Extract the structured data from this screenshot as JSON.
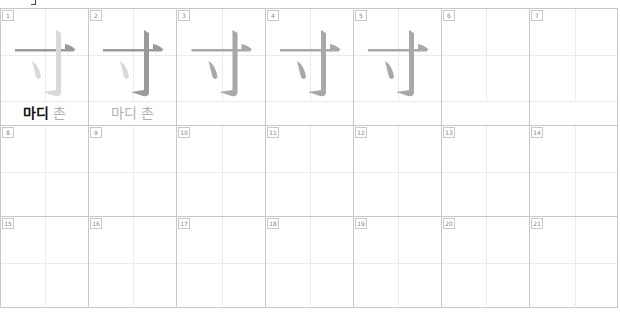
{
  "sheet": {
    "character": "寸",
    "columns": 7,
    "rows": 3,
    "cell_width": 88,
    "first_row_height": 117,
    "row_height": 91,
    "colors": {
      "grid_line": "#c8c8c8",
      "guide_line": "#ececec",
      "stroke_highlight": "#9a9a9a",
      "stroke_faint": "#d9d9d9",
      "stroke_complete": "#a8a8a8",
      "label_dark": "#111111",
      "label_light": "#b0b0b0"
    }
  },
  "cells": [
    {
      "number": "1",
      "strokes_shown": 3,
      "highlight_stroke": 1,
      "label_meaning": "마디",
      "label_sound": "촌",
      "label_style": "dark"
    },
    {
      "number": "2",
      "strokes_shown": 3,
      "highlight_stroke": 2,
      "label_meaning": "마디",
      "label_sound": "촌",
      "label_style": "light"
    },
    {
      "number": "3",
      "strokes_shown": 3,
      "highlight_stroke": 0
    },
    {
      "number": "4",
      "strokes_shown": 3,
      "highlight_stroke": 0
    },
    {
      "number": "5",
      "strokes_shown": 3,
      "highlight_stroke": 0
    },
    {
      "number": "6"
    },
    {
      "number": "7"
    },
    {
      "number": "8"
    },
    {
      "number": "9"
    },
    {
      "number": "10"
    },
    {
      "number": "11"
    },
    {
      "number": "12"
    },
    {
      "number": "13"
    },
    {
      "number": "14"
    },
    {
      "number": "15"
    },
    {
      "number": "16"
    },
    {
      "number": "17"
    },
    {
      "number": "18"
    },
    {
      "number": "19"
    },
    {
      "number": "20"
    },
    {
      "number": "21"
    }
  ]
}
